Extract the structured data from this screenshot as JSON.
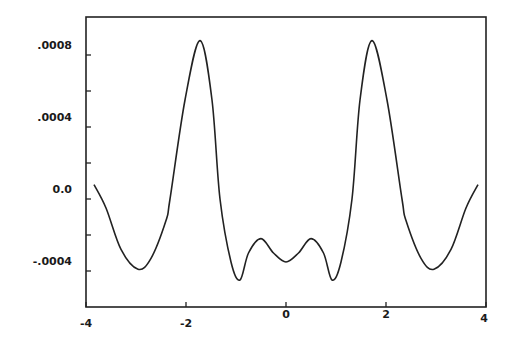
{
  "chart_data": {
    "type": "line",
    "title": "",
    "xlabel": "",
    "ylabel": "",
    "xlim": [
      -4,
      4
    ],
    "ylim": [
      -0.00058,
      0.00098
    ],
    "grid": false,
    "legend": null,
    "x_ticks": [
      -4,
      -2,
      0,
      2,
      4
    ],
    "x_tick_labels": [
      "-4",
      "-2",
      "0",
      "2",
      "4"
    ],
    "y_ticks_labeled": [
      0.0008,
      0.0004,
      0.0,
      -0.0004
    ],
    "y_tick_labels": [
      ".0008",
      ".0004",
      "0.0",
      "-.0004"
    ],
    "y_minor_ticks": [
      0.0008,
      0.0006,
      0.0004,
      0.0002,
      0.0,
      -0.0002,
      -0.0004
    ],
    "series": [
      {
        "name": "curve",
        "color": "#222222",
        "x": [
          -3.84,
          -3.6,
          -3.3,
          -2.96,
          -2.7,
          -2.4,
          -2.32,
          -2.02,
          -1.72,
          -1.48,
          -1.32,
          -1.1,
          -0.92,
          -0.75,
          -0.5,
          -0.25,
          0.0,
          0.25,
          0.5,
          0.75,
          0.92,
          1.1,
          1.32,
          1.48,
          1.72,
          2.02,
          2.32,
          2.4,
          2.7,
          2.96,
          3.3,
          3.6,
          3.84
        ],
        "y": [
          8e-05,
          -5e-05,
          -0.00028,
          -0.00039,
          -0.00033,
          -0.00012,
          0.0,
          0.00055,
          0.00088,
          0.00055,
          0.0,
          -0.00035,
          -0.00045,
          -0.0003,
          -0.00022,
          -0.0003,
          -0.00035,
          -0.0003,
          -0.00022,
          -0.0003,
          -0.00045,
          -0.00035,
          0.0,
          0.00055,
          0.00088,
          0.00055,
          0.0,
          -0.00012,
          -0.00033,
          -0.00039,
          -0.00028,
          -5e-05,
          8e-05
        ]
      }
    ]
  }
}
